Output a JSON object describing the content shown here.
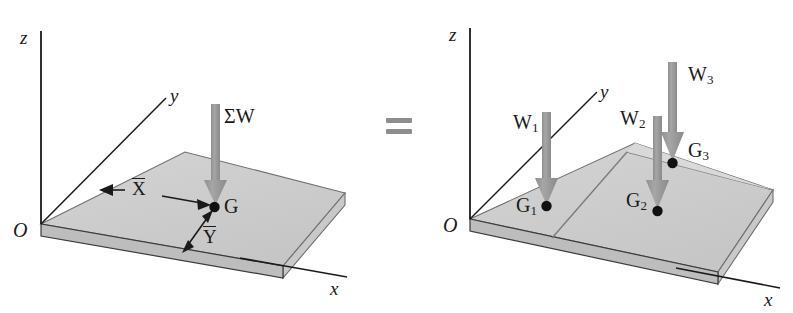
{
  "figure": {
    "equals_sign": "=",
    "colors": {
      "plate_top": "#cdcdcd",
      "plate_top_light": "#d6d6d6",
      "plate_side": "#d2d2d2",
      "plate_front_dark": "#b0b0b0",
      "arrow": "#9c9c9c",
      "line": "#1a1a1a",
      "background": "#ffffff"
    }
  },
  "left_diagram": {
    "name": "resultant-weight-plate",
    "axes": {
      "z_label": "z",
      "y_label": "y",
      "x_label": "x",
      "origin_label": "O"
    },
    "force": {
      "label": "ΣW",
      "name": "sigma-w-arrow",
      "direction": "down"
    },
    "centroid": {
      "point_label": "G",
      "x_bar_label": "X",
      "y_bar_label": "Y"
    }
  },
  "right_diagram": {
    "name": "component-weights-plate",
    "axes": {
      "z_label": "z",
      "y_label": "y",
      "x_label": "x",
      "origin_label": "O"
    },
    "forces": [
      {
        "label": "W",
        "subscript": "1",
        "name": "w1-arrow"
      },
      {
        "label": "W",
        "subscript": "2",
        "name": "w2-arrow"
      },
      {
        "label": "W",
        "subscript": "3",
        "name": "w3-arrow"
      }
    ],
    "centroids": [
      {
        "label": "G",
        "subscript": "1",
        "name": "g1-point"
      },
      {
        "label": "G",
        "subscript": "2",
        "name": "g2-point"
      },
      {
        "label": "G",
        "subscript": "3",
        "name": "g3-point"
      }
    ]
  }
}
